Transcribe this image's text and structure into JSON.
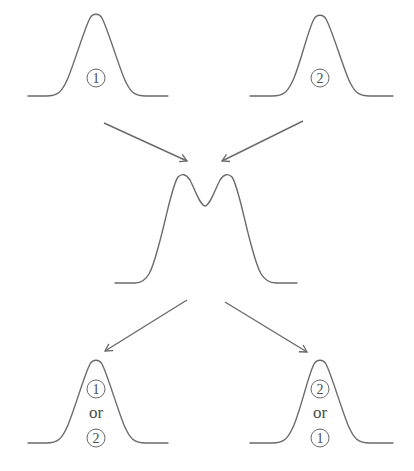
{
  "diagram": {
    "top_left": {
      "label": "1"
    },
    "top_right": {
      "label": "2"
    },
    "middle": {
      "description": "bimodal mixture"
    },
    "bottom_left": {
      "first": "1",
      "conj": "or",
      "second": "2"
    },
    "bottom_right": {
      "first": "2",
      "conj": "or",
      "second": "1"
    }
  },
  "colors": {
    "stroke": "#6a6a6a",
    "text": "#4a4a4a",
    "background": "#ffffff"
  }
}
